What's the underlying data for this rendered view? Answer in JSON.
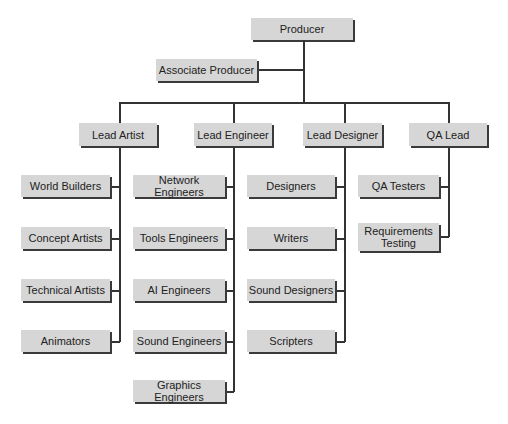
{
  "chart": {
    "root": "Producer",
    "assistant": "Associate Producer",
    "leads": [
      {
        "label": "Lead Artist",
        "reports": [
          "World Builders",
          "Concept Artists",
          "Technical Artists",
          "Animators"
        ]
      },
      {
        "label": "Lead Engineer",
        "reports": [
          "Network Engineers",
          "Tools Engineers",
          "AI Engineers",
          "Sound Engineers",
          "Graphics Engineers"
        ]
      },
      {
        "label": "Lead Designer",
        "reports": [
          "Designers",
          "Writers",
          "Sound Designers",
          "Scripters"
        ]
      },
      {
        "label": "QA Lead",
        "reports": [
          "QA Testers",
          "Requirements Testing"
        ]
      }
    ]
  },
  "colors": {
    "box_fill": "#d6d6d6",
    "shadow": "#3a3a3a",
    "line": "#333333"
  }
}
